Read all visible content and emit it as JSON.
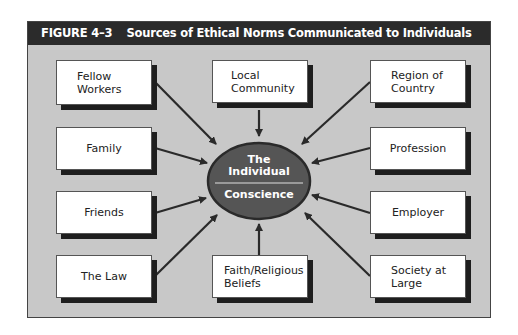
{
  "figure": {
    "number": "FIGURE 4–3",
    "title": "Sources of Ethical Norms Communicated to Individuals"
  },
  "center": {
    "top_label_line1": "The",
    "top_label_line2": "Individual",
    "bottom_label": "Conscience",
    "fill_color": "#555555"
  },
  "sources": [
    {
      "id": "fellow-workers",
      "line1": "Fellow",
      "line2": "Workers"
    },
    {
      "id": "local-community",
      "line1": "Local",
      "line2": "Community"
    },
    {
      "id": "region-of-country",
      "line1": "Region of",
      "line2": "Country"
    },
    {
      "id": "family",
      "line1": "Family",
      "line2": ""
    },
    {
      "id": "profession",
      "line1": "Profession",
      "line2": ""
    },
    {
      "id": "friends",
      "line1": "Friends",
      "line2": ""
    },
    {
      "id": "employer",
      "line1": "Employer",
      "line2": ""
    },
    {
      "id": "the-law",
      "line1": "The Law",
      "line2": ""
    },
    {
      "id": "faith-religious-beliefs",
      "line1": "Faith/Religious",
      "line2": "Beliefs"
    },
    {
      "id": "society-at-large",
      "line1": "Society at",
      "line2": "Large"
    }
  ],
  "colors": {
    "title_bar": "#2b2b2b",
    "panel": "#c8c8c8",
    "box": "#ffffff",
    "shadow": "#1e1e1e",
    "arrow": "#2a2a2a"
  }
}
